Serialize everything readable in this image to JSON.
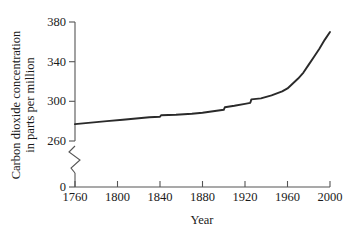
{
  "chart_data": {
    "type": "line",
    "title": "",
    "xlabel": "Year",
    "ylabel": "Carbon dioxide concentration in parts per million",
    "ylabel_line1": "Carbon dioxide concentration",
    "ylabel_line2": "in parts per million",
    "xlim": [
      1760,
      2000
    ],
    "ylim": [
      260,
      380
    ],
    "y_axis_break": true,
    "y_break_note": "axis broken between 0 and 260",
    "grid": false,
    "legend": null,
    "xticks": [
      1760,
      1800,
      1840,
      1880,
      1920,
      1960,
      2000
    ],
    "xtick_labels": [
      "1760",
      "1800",
      "1840",
      "1880",
      "1920",
      "1960",
      "2000"
    ],
    "yticks": [
      0,
      260,
      300,
      340,
      380
    ],
    "ytick_labels": [
      "0",
      "260",
      "300",
      "340",
      "380"
    ],
    "series": [
      {
        "name": "CO2 concentration",
        "color": "#2a2a2a",
        "x": [
          1760,
          1775,
          1790,
          1805,
          1820,
          1830,
          1840,
          1841,
          1855,
          1870,
          1880,
          1890,
          1900,
          1901,
          1910,
          1920,
          1925,
          1926,
          1935,
          1945,
          1955,
          1960,
          1965,
          1970,
          1975,
          1980,
          1985,
          1990,
          1995,
          2000
        ],
        "y": [
          277,
          278.5,
          280,
          281.5,
          283,
          284,
          284.5,
          286,
          286.5,
          287.5,
          288.5,
          290,
          291.5,
          294,
          295.5,
          297.5,
          298.5,
          302,
          303,
          306,
          310,
          313,
          318,
          323,
          329,
          337,
          345,
          353,
          362,
          370
        ]
      }
    ]
  }
}
